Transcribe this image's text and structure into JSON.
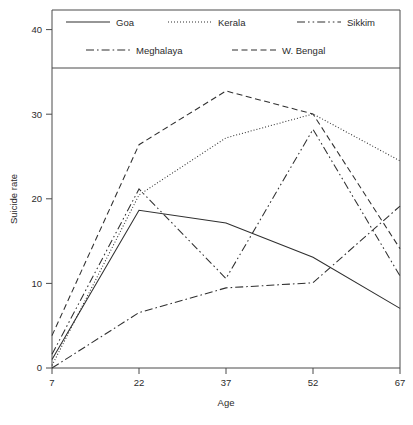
{
  "chart_data": {
    "type": "line",
    "title": "",
    "xlabel": "Age",
    "ylabel": "Suicide rate",
    "x": [
      7,
      22,
      37,
      52,
      67
    ],
    "xticklabels": [
      "7",
      "22",
      "37",
      "52",
      "67"
    ],
    "yticks": [
      0,
      10,
      20,
      30,
      40
    ],
    "yticklabels": [
      "0",
      "10",
      "20",
      "30",
      "40"
    ],
    "xlim": [
      7,
      67
    ],
    "ylim": [
      0,
      42
    ],
    "grid": false,
    "legend_position": "top",
    "series": [
      {
        "name": "Goa",
        "style": "solid",
        "values": [
          1.0,
          18.5,
          17.0,
          13.0,
          7.0
        ]
      },
      {
        "name": "Kerala",
        "style": "dotted",
        "values": [
          0.3,
          20.3,
          27.0,
          29.8,
          24.3
        ]
      },
      {
        "name": "Sikkim",
        "style": "dash-dot-dot",
        "values": [
          1.6,
          21.0,
          10.5,
          28.0,
          10.8
        ]
      },
      {
        "name": "Meghalaya",
        "style": "dash-dot",
        "values": [
          0.0,
          6.5,
          9.4,
          10.0,
          19.0
        ]
      },
      {
        "name": "W. Bengal",
        "style": "dashed",
        "values": [
          3.8,
          26.2,
          32.5,
          29.8,
          14.0
        ]
      }
    ]
  },
  "legend": {
    "entries": [
      {
        "label": "Goa"
      },
      {
        "label": "Kerala"
      },
      {
        "label": "Sikkim"
      },
      {
        "label": "Meghalaya"
      },
      {
        "label": "W. Bengal"
      }
    ]
  },
  "axes": {
    "y_title": "Suicide rate",
    "x_title": "Age"
  }
}
